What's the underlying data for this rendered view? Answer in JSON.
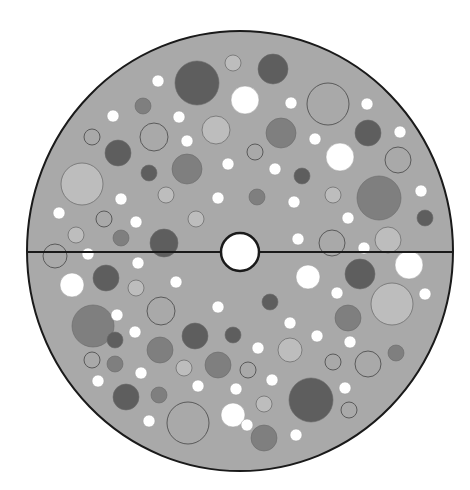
{
  "diagram": {
    "title": "",
    "colors": {
      "background": "#ffffff",
      "disk_fill": "#a9a9a9",
      "outline": "#1a1a1a",
      "white": "#ffffff",
      "light": "#bdbdbd",
      "medium": "#7f7f7f",
      "dark": "#5e5e5e",
      "outlined": "#a9a9a9",
      "stroke_thin": "#6f6f6f"
    },
    "disk": {
      "cx": 240,
      "cy": 251,
      "rx": 213,
      "ry": 220
    },
    "divider": {
      "y": 252,
      "x1": 27,
      "x2": 453
    },
    "center_hole": {
      "cx": 240,
      "cy": 252,
      "r": 19
    },
    "circles": [
      {
        "cx": 197,
        "cy": 83,
        "r": 22,
        "shade": "dark"
      },
      {
        "cx": 158,
        "cy": 81,
        "r": 6,
        "shade": "white"
      },
      {
        "cx": 233,
        "cy": 63,
        "r": 8,
        "shade": "light"
      },
      {
        "cx": 273,
        "cy": 69,
        "r": 15,
        "shade": "dark"
      },
      {
        "cx": 143,
        "cy": 106,
        "r": 8,
        "shade": "medium"
      },
      {
        "cx": 113,
        "cy": 116,
        "r": 6,
        "shade": "white"
      },
      {
        "cx": 179,
        "cy": 117,
        "r": 6,
        "shade": "white"
      },
      {
        "cx": 245,
        "cy": 100,
        "r": 14,
        "shade": "white"
      },
      {
        "cx": 291,
        "cy": 103,
        "r": 6,
        "shade": "white"
      },
      {
        "cx": 328,
        "cy": 104,
        "r": 21,
        "shade": "outlined"
      },
      {
        "cx": 367,
        "cy": 104,
        "r": 6,
        "shade": "white"
      },
      {
        "cx": 216,
        "cy": 130,
        "r": 14,
        "shade": "light"
      },
      {
        "cx": 92,
        "cy": 137,
        "r": 8,
        "shade": "outlined"
      },
      {
        "cx": 154,
        "cy": 137,
        "r": 14,
        "shade": "outlined"
      },
      {
        "cx": 187,
        "cy": 141,
        "r": 6,
        "shade": "white"
      },
      {
        "cx": 281,
        "cy": 133,
        "r": 15,
        "shade": "medium"
      },
      {
        "cx": 368,
        "cy": 133,
        "r": 13,
        "shade": "dark"
      },
      {
        "cx": 400,
        "cy": 132,
        "r": 6,
        "shade": "white"
      },
      {
        "cx": 118,
        "cy": 153,
        "r": 13,
        "shade": "dark"
      },
      {
        "cx": 255,
        "cy": 152,
        "r": 8,
        "shade": "outlined"
      },
      {
        "cx": 315,
        "cy": 139,
        "r": 6,
        "shade": "white"
      },
      {
        "cx": 340,
        "cy": 157,
        "r": 14,
        "shade": "white"
      },
      {
        "cx": 398,
        "cy": 160,
        "r": 13,
        "shade": "outlined"
      },
      {
        "cx": 149,
        "cy": 173,
        "r": 8,
        "shade": "dark"
      },
      {
        "cx": 187,
        "cy": 169,
        "r": 15,
        "shade": "medium"
      },
      {
        "cx": 228,
        "cy": 164,
        "r": 6,
        "shade": "white"
      },
      {
        "cx": 275,
        "cy": 169,
        "r": 6,
        "shade": "white"
      },
      {
        "cx": 302,
        "cy": 176,
        "r": 8,
        "shade": "dark"
      },
      {
        "cx": 82,
        "cy": 184,
        "r": 21,
        "shade": "light"
      },
      {
        "cx": 121,
        "cy": 199,
        "r": 6,
        "shade": "white"
      },
      {
        "cx": 166,
        "cy": 195,
        "r": 8,
        "shade": "light"
      },
      {
        "cx": 218,
        "cy": 198,
        "r": 6,
        "shade": "white"
      },
      {
        "cx": 257,
        "cy": 197,
        "r": 8,
        "shade": "medium"
      },
      {
        "cx": 333,
        "cy": 195,
        "r": 8,
        "shade": "light"
      },
      {
        "cx": 294,
        "cy": 202,
        "r": 6,
        "shade": "white"
      },
      {
        "cx": 379,
        "cy": 198,
        "r": 22,
        "shade": "medium"
      },
      {
        "cx": 421,
        "cy": 191,
        "r": 6,
        "shade": "white"
      },
      {
        "cx": 59,
        "cy": 213,
        "r": 6,
        "shade": "white"
      },
      {
        "cx": 104,
        "cy": 219,
        "r": 8,
        "shade": "outlined"
      },
      {
        "cx": 136,
        "cy": 222,
        "r": 6,
        "shade": "white"
      },
      {
        "cx": 196,
        "cy": 219,
        "r": 8,
        "shade": "light"
      },
      {
        "cx": 348,
        "cy": 218,
        "r": 6,
        "shade": "white"
      },
      {
        "cx": 425,
        "cy": 218,
        "r": 8,
        "shade": "dark"
      },
      {
        "cx": 76,
        "cy": 235,
        "r": 8,
        "shade": "light"
      },
      {
        "cx": 121,
        "cy": 238,
        "r": 8,
        "shade": "medium"
      },
      {
        "cx": 164,
        "cy": 243,
        "r": 14,
        "shade": "dark"
      },
      {
        "cx": 298,
        "cy": 239,
        "r": 6,
        "shade": "white"
      },
      {
        "cx": 332,
        "cy": 243,
        "r": 13,
        "shade": "outlined"
      },
      {
        "cx": 364,
        "cy": 248,
        "r": 6,
        "shade": "white"
      },
      {
        "cx": 388,
        "cy": 240,
        "r": 13,
        "shade": "light"
      },
      {
        "cx": 55,
        "cy": 256,
        "r": 12,
        "shade": "outlined"
      },
      {
        "cx": 88,
        "cy": 254,
        "r": 6,
        "shade": "white"
      },
      {
        "cx": 72,
        "cy": 285,
        "r": 12,
        "shade": "white"
      },
      {
        "cx": 106,
        "cy": 278,
        "r": 13,
        "shade": "dark"
      },
      {
        "cx": 136,
        "cy": 288,
        "r": 8,
        "shade": "light"
      },
      {
        "cx": 138,
        "cy": 263,
        "r": 6,
        "shade": "white"
      },
      {
        "cx": 176,
        "cy": 282,
        "r": 6,
        "shade": "white"
      },
      {
        "cx": 161,
        "cy": 311,
        "r": 14,
        "shade": "outlined"
      },
      {
        "cx": 218,
        "cy": 307,
        "r": 6,
        "shade": "white"
      },
      {
        "cx": 308,
        "cy": 277,
        "r": 12,
        "shade": "white"
      },
      {
        "cx": 360,
        "cy": 274,
        "r": 15,
        "shade": "dark"
      },
      {
        "cx": 409,
        "cy": 265,
        "r": 14,
        "shade": "white"
      },
      {
        "cx": 337,
        "cy": 293,
        "r": 6,
        "shade": "white"
      },
      {
        "cx": 392,
        "cy": 304,
        "r": 21,
        "shade": "light"
      },
      {
        "cx": 425,
        "cy": 294,
        "r": 6,
        "shade": "white"
      },
      {
        "cx": 270,
        "cy": 302,
        "r": 8,
        "shade": "dark"
      },
      {
        "cx": 93,
        "cy": 326,
        "r": 21,
        "shade": "medium"
      },
      {
        "cx": 117,
        "cy": 315,
        "r": 6,
        "shade": "white"
      },
      {
        "cx": 135,
        "cy": 332,
        "r": 6,
        "shade": "white"
      },
      {
        "cx": 115,
        "cy": 340,
        "r": 8,
        "shade": "dark"
      },
      {
        "cx": 195,
        "cy": 336,
        "r": 13,
        "shade": "dark"
      },
      {
        "cx": 233,
        "cy": 335,
        "r": 8,
        "shade": "dark"
      },
      {
        "cx": 290,
        "cy": 323,
        "r": 6,
        "shade": "white"
      },
      {
        "cx": 348,
        "cy": 318,
        "r": 13,
        "shade": "medium"
      },
      {
        "cx": 92,
        "cy": 360,
        "r": 8,
        "shade": "outlined"
      },
      {
        "cx": 115,
        "cy": 364,
        "r": 8,
        "shade": "medium"
      },
      {
        "cx": 160,
        "cy": 350,
        "r": 13,
        "shade": "medium"
      },
      {
        "cx": 258,
        "cy": 348,
        "r": 6,
        "shade": "white"
      },
      {
        "cx": 290,
        "cy": 350,
        "r": 12,
        "shade": "light"
      },
      {
        "cx": 317,
        "cy": 336,
        "r": 6,
        "shade": "white"
      },
      {
        "cx": 350,
        "cy": 342,
        "r": 6,
        "shade": "white"
      },
      {
        "cx": 98,
        "cy": 381,
        "r": 6,
        "shade": "white"
      },
      {
        "cx": 141,
        "cy": 373,
        "r": 6,
        "shade": "white"
      },
      {
        "cx": 184,
        "cy": 368,
        "r": 8,
        "shade": "light"
      },
      {
        "cx": 218,
        "cy": 365,
        "r": 13,
        "shade": "medium"
      },
      {
        "cx": 248,
        "cy": 370,
        "r": 8,
        "shade": "outlined"
      },
      {
        "cx": 272,
        "cy": 380,
        "r": 6,
        "shade": "white"
      },
      {
        "cx": 333,
        "cy": 362,
        "r": 8,
        "shade": "outlined"
      },
      {
        "cx": 368,
        "cy": 364,
        "r": 13,
        "shade": "outlined"
      },
      {
        "cx": 396,
        "cy": 353,
        "r": 8,
        "shade": "medium"
      },
      {
        "cx": 126,
        "cy": 397,
        "r": 13,
        "shade": "dark"
      },
      {
        "cx": 159,
        "cy": 395,
        "r": 8,
        "shade": "medium"
      },
      {
        "cx": 198,
        "cy": 386,
        "r": 6,
        "shade": "white"
      },
      {
        "cx": 236,
        "cy": 389,
        "r": 6,
        "shade": "white"
      },
      {
        "cx": 264,
        "cy": 404,
        "r": 8,
        "shade": "light"
      },
      {
        "cx": 311,
        "cy": 400,
        "r": 22,
        "shade": "dark"
      },
      {
        "cx": 345,
        "cy": 388,
        "r": 6,
        "shade": "white"
      },
      {
        "cx": 349,
        "cy": 410,
        "r": 8,
        "shade": "outlined"
      },
      {
        "cx": 149,
        "cy": 421,
        "r": 6,
        "shade": "white"
      },
      {
        "cx": 188,
        "cy": 423,
        "r": 21,
        "shade": "outlined"
      },
      {
        "cx": 233,
        "cy": 415,
        "r": 12,
        "shade": "white"
      },
      {
        "cx": 247,
        "cy": 425,
        "r": 6,
        "shade": "white"
      },
      {
        "cx": 264,
        "cy": 438,
        "r": 13,
        "shade": "medium"
      },
      {
        "cx": 296,
        "cy": 435,
        "r": 6,
        "shade": "white"
      }
    ]
  }
}
